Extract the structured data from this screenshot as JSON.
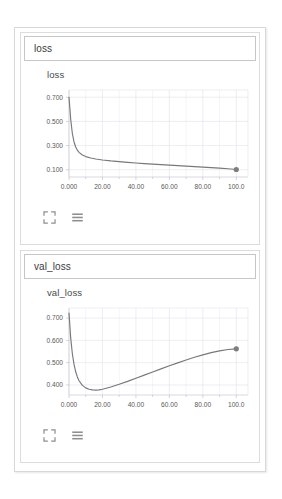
{
  "panel": {
    "cards": [
      {
        "header_label": "loss",
        "chart_title": "loss",
        "toolbar": {
          "expand_icon": "expand-icon",
          "menu_icon": "hamburger-menu-icon"
        }
      },
      {
        "header_label": "val_loss",
        "chart_title": "val_loss",
        "toolbar": {
          "expand_icon": "expand-icon",
          "menu_icon": "hamburger-menu-icon"
        }
      }
    ]
  },
  "colors": {
    "series_line": "#787878",
    "endpoint_marker": "#7d7d7d",
    "gridline": "#e2e2ea",
    "axis": "#c9c9d2",
    "card_border": "#dcdcdc",
    "header_border": "#c6c6c6",
    "frame_border": "#d8d8d8",
    "text": "#3a3a3a",
    "tick_text": "#585858",
    "background": "#ffffff"
  },
  "chart_data": [
    {
      "type": "line",
      "title": "loss",
      "xlabel": "",
      "ylabel": "",
      "grid": true,
      "legend": "none",
      "xlim": [
        0,
        107
      ],
      "ylim": [
        0.04,
        0.76
      ],
      "xticks": [
        0,
        20,
        40,
        60,
        80,
        100
      ],
      "xticklabels": [
        "0.000",
        "20.00",
        "40.00",
        "60.00",
        "80.00",
        "100.0"
      ],
      "yticks": [
        0.1,
        0.3,
        0.5,
        0.7
      ],
      "yticklabels": [
        "0.100",
        "0.300",
        "0.500",
        "0.700"
      ],
      "series": [
        {
          "name": "loss",
          "x": [
            0,
            1,
            2,
            3,
            4,
            5,
            6,
            8,
            10,
            13,
            16,
            20,
            25,
            30,
            35,
            40,
            45,
            50,
            55,
            60,
            65,
            70,
            75,
            80,
            85,
            90,
            95,
            100
          ],
          "values": [
            0.7,
            0.52,
            0.4,
            0.33,
            0.288,
            0.262,
            0.244,
            0.222,
            0.209,
            0.197,
            0.189,
            0.181,
            0.173,
            0.167,
            0.161,
            0.156,
            0.151,
            0.147,
            0.142,
            0.138,
            0.134,
            0.13,
            0.126,
            0.122,
            0.118,
            0.113,
            0.108,
            0.102
          ],
          "endpoint": {
            "x": 100,
            "y": 0.102,
            "marker": "circle"
          }
        }
      ]
    },
    {
      "type": "line",
      "title": "val_loss",
      "xlabel": "",
      "ylabel": "",
      "grid": true,
      "legend": "none",
      "xlim": [
        0,
        107
      ],
      "ylim": [
        0.355,
        0.745
      ],
      "xticks": [
        0,
        20,
        40,
        60,
        80,
        100
      ],
      "xticklabels": [
        "0.000",
        "20.00",
        "40.00",
        "60.00",
        "80.00",
        "100.0"
      ],
      "yticks": [
        0.4,
        0.5,
        0.6,
        0.7
      ],
      "yticklabels": [
        "0.400",
        "0.500",
        "0.600",
        "0.700"
      ],
      "series": [
        {
          "name": "val_loss",
          "x": [
            0,
            1,
            2,
            3,
            4,
            5,
            6,
            8,
            10,
            12,
            14,
            16,
            18,
            20,
            25,
            30,
            35,
            40,
            45,
            50,
            55,
            60,
            65,
            70,
            75,
            80,
            85,
            90,
            95,
            100
          ],
          "values": [
            0.722,
            0.612,
            0.54,
            0.492,
            0.459,
            0.436,
            0.419,
            0.398,
            0.387,
            0.381,
            0.378,
            0.377,
            0.378,
            0.381,
            0.391,
            0.403,
            0.416,
            0.43,
            0.444,
            0.458,
            0.472,
            0.486,
            0.499,
            0.512,
            0.524,
            0.535,
            0.545,
            0.553,
            0.559,
            0.562
          ],
          "endpoint": {
            "x": 100,
            "y": 0.562,
            "marker": "circle"
          }
        }
      ]
    }
  ]
}
